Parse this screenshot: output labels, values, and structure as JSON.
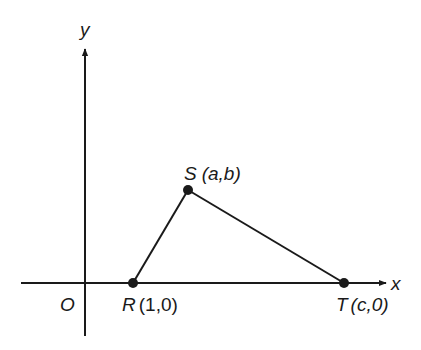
{
  "diagram": {
    "axes": {
      "x_label": "x",
      "y_label": "y",
      "origin_label": "O"
    },
    "points": {
      "R": {
        "name": "R",
        "coords": "(1,0)"
      },
      "S": {
        "name": "S",
        "coords": "(a,b)"
      },
      "T": {
        "name": "T",
        "coords": "(c,0)"
      }
    },
    "segments": [
      "RS",
      "ST"
    ],
    "colors": {
      "stroke": "#1a1a1a",
      "background": "#ffffff"
    }
  }
}
